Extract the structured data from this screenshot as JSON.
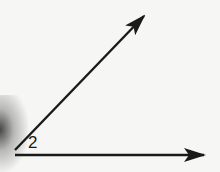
{
  "diagram": {
    "type": "angle",
    "angle_label": "2",
    "vertex": [
      15,
      152
    ],
    "rays": [
      {
        "name": "upper-ray",
        "from": [
          15,
          150
        ],
        "to": [
          144,
          16
        ]
      },
      {
        "name": "lower-ray",
        "from": [
          15,
          155
        ],
        "to": [
          204,
          155
        ]
      }
    ],
    "colors": {
      "line": "#1a1a1a",
      "background": "#f6f6f4"
    }
  }
}
